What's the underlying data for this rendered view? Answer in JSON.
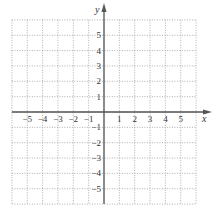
{
  "chart_data": {
    "type": "scatter",
    "title": "",
    "xlabel": "x",
    "ylabel": "y",
    "xlim": [
      -6,
      6
    ],
    "ylim": [
      -6,
      6
    ],
    "grid": true,
    "grid_style": "dotted",
    "x_ticks": [
      -5,
      -4,
      -3,
      -2,
      -1,
      1,
      2,
      3,
      4,
      5
    ],
    "y_ticks": [
      5,
      4,
      3,
      2,
      1,
      -1,
      -2,
      -3,
      -4,
      -5
    ],
    "x_tick_labels": [
      "−5",
      "−4",
      "−3",
      "−2",
      "−1",
      "1",
      "2",
      "3",
      "4",
      "5"
    ],
    "y_tick_labels": [
      "5",
      "4",
      "3",
      "2",
      "1",
      "−1",
      "−2",
      "−3",
      "−4",
      "−5"
    ],
    "series": [],
    "colors": {
      "axis": "#555555",
      "grid": "#9a9a9a",
      "text": "#333333"
    }
  }
}
